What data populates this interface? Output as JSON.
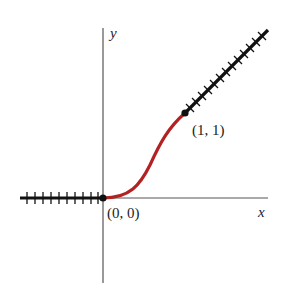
{
  "diagram": {
    "axes": {
      "x_label": "x",
      "y_label": "y"
    },
    "points": [
      {
        "label": "(0, 0)",
        "x": 0,
        "y": 0
      },
      {
        "label": "(1, 1)",
        "x": 1,
        "y": 1
      }
    ],
    "segments": [
      {
        "name": "left-ray",
        "description": "horizontal hatched line y=0 for x<0"
      },
      {
        "name": "connecting-curve",
        "description": "smooth S-curve from (0,0) to (1,1)",
        "color": "#b22222"
      },
      {
        "name": "right-ray",
        "description": "hatched line y=x for x>1"
      }
    ],
    "colors": {
      "curve": "#b22222",
      "rays": "#111111",
      "axes": "#555555"
    }
  }
}
